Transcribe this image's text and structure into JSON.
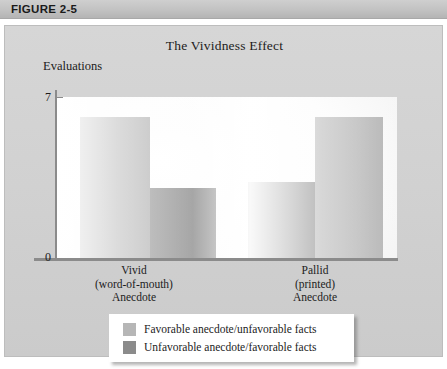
{
  "figure": {
    "header_label": "FIGURE 2-5"
  },
  "chart_data": {
    "type": "bar",
    "title": "The Vividness Effect",
    "xlabel": "",
    "ylabel": "Evaluations",
    "ylim": [
      0,
      8
    ],
    "yticks": [
      "0",
      "7"
    ],
    "ytick_values": [
      0,
      7
    ],
    "grid": false,
    "legend_position": "bottom-center",
    "categories": [
      "Vivid\n(word-of-mouth)\nAnecdote",
      "Pallid\n(printed)\nAnecdote"
    ],
    "category_lines": [
      [
        "Vivid",
        "(word-of-mouth)",
        "Anecdote"
      ],
      [
        "Pallid",
        "(printed)",
        "Anecdote"
      ]
    ],
    "series": [
      {
        "name": "Favorable anecdote/unfavorable facts",
        "color": "#b0b0b0",
        "values": [
          7,
          7
        ]
      },
      {
        "name": "Unfavorable anecdote/favorable facts",
        "color": "#898989",
        "values": [
          3.5,
          3.8
        ]
      }
    ]
  },
  "legend": {
    "items": [
      {
        "label": "Favorable anecdote/unfavorable facts",
        "swatch": "light"
      },
      {
        "label": "Unfavorable anecdote/favorable facts",
        "swatch": "dark"
      }
    ]
  }
}
